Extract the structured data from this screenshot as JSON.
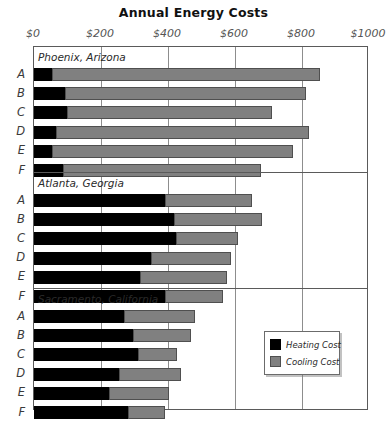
{
  "chart_data": {
    "type": "bar",
    "orientation": "horizontal",
    "stacked": true,
    "title": "Annual Energy Costs",
    "xlabel": "",
    "ylabel": "",
    "xlim": [
      0,
      1000
    ],
    "xticks": [
      0,
      200,
      400,
      600,
      800,
      1000
    ],
    "xtick_labels": [
      "$0",
      "$200",
      "$400",
      "$600",
      "$800",
      "$1000"
    ],
    "grid": true,
    "legend_position": "inside-bottom-right",
    "series": [
      {
        "name": "Heating Cost",
        "color": "#000000"
      },
      {
        "name": "Cooling Cost",
        "color": "#808080"
      }
    ],
    "groups": [
      {
        "name": "Phoenix, Arizona",
        "categories": [
          "A",
          "B",
          "C",
          "D",
          "E",
          "F"
        ],
        "heating": [
          54,
          93,
          99,
          66,
          54,
          87
        ],
        "cooling": [
          800,
          719,
          611,
          755,
          719,
          591
        ],
        "totals": [
          854,
          812,
          710,
          821,
          773,
          678
        ]
      },
      {
        "name": "Atlanta, Georgia",
        "categories": [
          "A",
          "B",
          "C",
          "D",
          "E",
          "F"
        ],
        "heating": [
          391,
          418,
          424,
          349,
          316,
          391
        ],
        "cooling": [
          260,
          263,
          185,
          239,
          260,
          173
        ],
        "totals": [
          651,
          681,
          609,
          588,
          576,
          564
        ]
      },
      {
        "name": "Sacramento, California",
        "categories": [
          "A",
          "B",
          "C",
          "D",
          "E",
          "F"
        ],
        "heating": [
          269,
          295,
          310,
          254,
          224,
          281
        ],
        "cooling": [
          212,
          173,
          117,
          185,
          179,
          110
        ],
        "totals": [
          481,
          468,
          427,
          439,
          403,
          391
        ]
      }
    ]
  },
  "legend": {
    "items": [
      {
        "label": "Heating Cost",
        "swatch": "heating"
      },
      {
        "label": "Cooling Cost",
        "swatch": "cooling"
      }
    ]
  }
}
